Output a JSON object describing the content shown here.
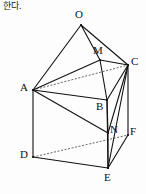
{
  "page": {
    "width": 146,
    "height": 194,
    "background": "#fdfdfd",
    "header_text": "을 한다."
  },
  "figure": {
    "stroke_color": "#111111",
    "dashed_color": "#555555",
    "stroke_width": 1.1,
    "vertices": [
      {
        "id": "O",
        "label": "O",
        "x": 81,
        "y": 25,
        "label_x": 75,
        "label_y": 9
      },
      {
        "id": "M",
        "label": "M",
        "x": 100,
        "y": 60,
        "label_x": 93,
        "label_y": 45
      },
      {
        "id": "C",
        "label": "C",
        "x": 128,
        "y": 65,
        "label_x": 131,
        "label_y": 56
      },
      {
        "id": "A",
        "label": "A",
        "x": 33,
        "y": 90,
        "label_x": 20,
        "label_y": 82
      },
      {
        "id": "B",
        "label": "B",
        "x": 107,
        "y": 100,
        "label_x": 96,
        "label_y": 101
      },
      {
        "id": "N",
        "label": "N",
        "x": 108,
        "y": 133,
        "label_x": 110,
        "label_y": 124
      },
      {
        "id": "F",
        "label": "F",
        "x": 128,
        "y": 135,
        "label_x": 130,
        "label_y": 126
      },
      {
        "id": "D",
        "label": "D",
        "x": 33,
        "y": 157,
        "label_x": 20,
        "label_y": 149
      },
      {
        "id": "E",
        "label": "E",
        "x": 108,
        "y": 168,
        "label_x": 104,
        "label_y": 172
      }
    ],
    "solid_edges": [
      [
        "O",
        "A"
      ],
      [
        "O",
        "M"
      ],
      [
        "O",
        "C"
      ],
      [
        "M",
        "C"
      ],
      [
        "M",
        "B"
      ],
      [
        "M",
        "A"
      ],
      [
        "A",
        "B"
      ],
      [
        "B",
        "C"
      ],
      [
        "A",
        "N"
      ],
      [
        "A",
        "D"
      ],
      [
        "B",
        "N"
      ],
      [
        "C",
        "N"
      ],
      [
        "C",
        "F"
      ],
      [
        "N",
        "E"
      ],
      [
        "C",
        "E"
      ],
      [
        "D",
        "E"
      ],
      [
        "E",
        "F"
      ],
      [
        "B",
        "E"
      ]
    ],
    "dashed_edges": [
      [
        "A",
        "C"
      ],
      [
        "D",
        "F"
      ]
    ]
  }
}
